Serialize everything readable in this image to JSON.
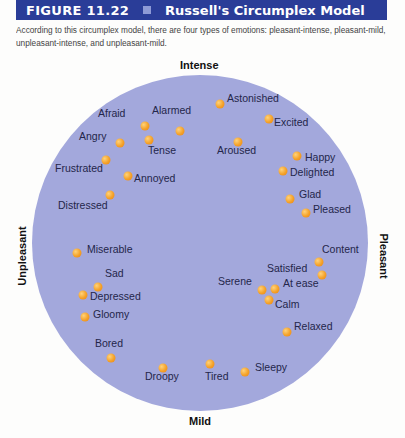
{
  "header": {
    "figure_number": "FIGURE 11.22",
    "title": "Russell's Circumplex Model",
    "band_color": "#2a3d98"
  },
  "caption": "According to this circumplex model, there are four types of emotions: pleasant-intense, pleasant-mild, unpleasant-intense, and unpleasant-mild.",
  "axes": {
    "top": "Intense",
    "bottom": "Mild",
    "left": "Unpleasant",
    "right": "Pleasant"
  },
  "colors": {
    "circle_fill": "#a3a8dc",
    "dot": "#f4a128",
    "label_text": "#23264a"
  },
  "emotions": [
    {
      "label": "Afraid",
      "dot": [
        145,
        126
      ],
      "text": [
        98,
        113
      ]
    },
    {
      "label": "Alarmed",
      "dot": [
        180,
        131
      ],
      "text": [
        152,
        110
      ]
    },
    {
      "label": "Tense",
      "dot": [
        149,
        140
      ],
      "text": [
        148,
        150
      ]
    },
    {
      "label": "Angry",
      "dot": [
        120,
        143
      ],
      "text": [
        79,
        136
      ]
    },
    {
      "label": "Frustrated",
      "dot": [
        106,
        160
      ],
      "text": [
        55,
        168
      ]
    },
    {
      "label": "Annoyed",
      "dot": [
        128,
        176
      ],
      "text": [
        134,
        178
      ]
    },
    {
      "label": "Distressed",
      "dot": [
        110,
        195
      ],
      "text": [
        58,
        205
      ]
    },
    {
      "label": "Astonished",
      "dot": [
        220,
        104
      ],
      "text": [
        227,
        98
      ]
    },
    {
      "label": "Excited",
      "dot": [
        269,
        119
      ],
      "text": [
        274,
        122
      ]
    },
    {
      "label": "Aroused",
      "dot": [
        238,
        142
      ],
      "text": [
        217,
        150
      ]
    },
    {
      "label": "Happy",
      "dot": [
        297,
        156
      ],
      "text": [
        305,
        157
      ]
    },
    {
      "label": "Delighted",
      "dot": [
        283,
        171
      ],
      "text": [
        290,
        172
      ]
    },
    {
      "label": "Glad",
      "dot": [
        290,
        199
      ],
      "text": [
        299,
        194
      ]
    },
    {
      "label": "Pleased",
      "dot": [
        306,
        213
      ],
      "text": [
        313,
        209
      ]
    },
    {
      "label": "Miserable",
      "dot": [
        77,
        253
      ],
      "text": [
        87,
        249
      ]
    },
    {
      "label": "Sad",
      "dot": [
        98,
        287
      ],
      "text": [
        105,
        273
      ]
    },
    {
      "label": "Depressed",
      "dot": [
        83,
        295
      ],
      "text": [
        90,
        296
      ]
    },
    {
      "label": "Gloomy",
      "dot": [
        85,
        317
      ],
      "text": [
        93,
        314
      ]
    },
    {
      "label": "Content",
      "dot": [
        319,
        262
      ],
      "text": [
        322,
        249
      ]
    },
    {
      "label": "Satisfied",
      "dot": [
        322,
        275
      ],
      "text": [
        267,
        268
      ]
    },
    {
      "label": "Serene",
      "dot": [
        262,
        290
      ],
      "text": [
        218,
        281
      ]
    },
    {
      "label": "At ease",
      "dot": [
        275,
        289
      ],
      "text": [
        283,
        283
      ]
    },
    {
      "label": "Calm",
      "dot": [
        269,
        300
      ],
      "text": [
        275,
        304
      ]
    },
    {
      "label": "Relaxed",
      "dot": [
        287,
        332
      ],
      "text": [
        294,
        326
      ]
    },
    {
      "label": "Bored",
      "dot": [
        111,
        358
      ],
      "text": [
        95,
        343
      ]
    },
    {
      "label": "Droopy",
      "dot": [
        163,
        368
      ],
      "text": [
        145,
        376
      ]
    },
    {
      "label": "Tired",
      "dot": [
        210,
        364
      ],
      "text": [
        205,
        376
      ]
    },
    {
      "label": "Sleepy",
      "dot": [
        245,
        372
      ],
      "text": [
        255,
        367
      ]
    }
  ]
}
